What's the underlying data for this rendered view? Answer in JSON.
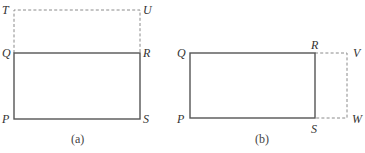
{
  "figures": [
    {
      "caption": "(a)",
      "labels": {
        "T": "T",
        "U": "U",
        "Q": "Q",
        "R": "R",
        "P": "P",
        "S": "S"
      },
      "description": "Rectangle PQRS (solid) with dashed extension QTUR above"
    },
    {
      "caption": "(b)",
      "labels": {
        "Q": "Q",
        "R": "R",
        "P": "P",
        "S": "S",
        "V": "V",
        "W": "W"
      },
      "description": "Rectangle PQRS (solid) with dashed extension RVWS to the right"
    }
  ],
  "colors": {
    "solid_line": "#555555",
    "dashed_line": "#8a8a8a",
    "text": "#333333"
  }
}
